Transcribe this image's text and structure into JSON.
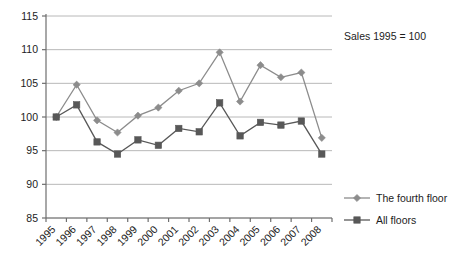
{
  "chart_data": {
    "type": "line",
    "title": "",
    "subtitle": "",
    "annotation": "Sales 1995 = 100",
    "xlabel": "",
    "ylabel": "",
    "categories": [
      "1995",
      "1996",
      "1997",
      "1998",
      "1999",
      "2000",
      "2001",
      "2002",
      "2003",
      "2004",
      "2005",
      "2006",
      "2007",
      "2008"
    ],
    "ylim": [
      85,
      115
    ],
    "yticks": [
      85,
      90,
      95,
      100,
      105,
      110,
      115
    ],
    "ytick_labels": [
      "85",
      "90",
      "95",
      "100",
      "105",
      "110",
      "115"
    ],
    "grid": true,
    "legend_position": "right-bottom",
    "series": [
      {
        "name": "The fourth floor",
        "marker": "diamond",
        "color": "#8c8c8c",
        "values": [
          100.0,
          104.8,
          99.5,
          97.7,
          100.2,
          101.4,
          103.9,
          105.0,
          109.6,
          102.3,
          107.7,
          105.9,
          106.6,
          96.9
        ]
      },
      {
        "name": "All floors",
        "marker": "square",
        "color": "#585858",
        "values": [
          100.0,
          101.8,
          96.3,
          94.5,
          96.6,
          95.8,
          98.3,
          97.8,
          102.1,
          97.2,
          99.2,
          98.8,
          99.4,
          94.5
        ]
      }
    ]
  },
  "legend": {
    "items": [
      {
        "label": "The fourth floor"
      },
      {
        "label": "All floors"
      }
    ]
  },
  "annotation": {
    "text": "Sales 1995 = 100"
  },
  "colors": {
    "series_fourth_floor": "#8c8c8c",
    "series_all_floors": "#585858",
    "grid": "#b8b8b8",
    "axis": "#6e6e6e",
    "text": "#1c1c1c",
    "background": "#ffffff"
  }
}
